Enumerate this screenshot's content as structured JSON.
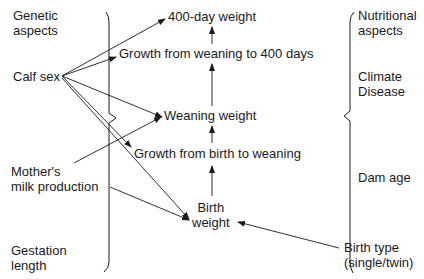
{
  "diagram": {
    "left_column": {
      "genetic_aspects": "Genetic\naspects",
      "calf_sex": "Calf sex",
      "mothers_milk": "Mother's\nmilk production",
      "gestation_length": "Gestation\nlength"
    },
    "center_column": {
      "weight_400": "400-day weight",
      "growth_wean_400": "Growth from weaning to 400 days",
      "weaning_weight": "Weaning weight",
      "growth_birth_wean": "Growth from birth to weaning",
      "birth_weight": "Birth\nweight"
    },
    "right_column": {
      "nutritional_aspects": "Nutritional\naspects",
      "climate_disease": "Climate\nDisease",
      "dam_age": "Dam age",
      "birth_type": "Birth type\n(single/twin)"
    },
    "edges": [
      {
        "from": "calf_sex",
        "to": "weight_400"
      },
      {
        "from": "calf_sex",
        "to": "growth_wean_400"
      },
      {
        "from": "calf_sex",
        "to": "weaning_weight"
      },
      {
        "from": "calf_sex",
        "to": "growth_birth_wean"
      },
      {
        "from": "calf_sex",
        "to": "birth_weight"
      },
      {
        "from": "mothers_milk",
        "to": "weaning_weight"
      },
      {
        "from": "mothers_milk",
        "to": "birth_weight"
      },
      {
        "from": "birth_type",
        "to": "birth_weight"
      },
      {
        "from": "birth_weight",
        "to": "growth_birth_wean"
      },
      {
        "from": "growth_birth_wean",
        "to": "weaning_weight"
      },
      {
        "from": "weaning_weight",
        "to": "growth_wean_400"
      },
      {
        "from": "growth_wean_400",
        "to": "weight_400"
      }
    ],
    "colors": {
      "ink": "#1a1a1a",
      "background": "#ffffff"
    }
  }
}
